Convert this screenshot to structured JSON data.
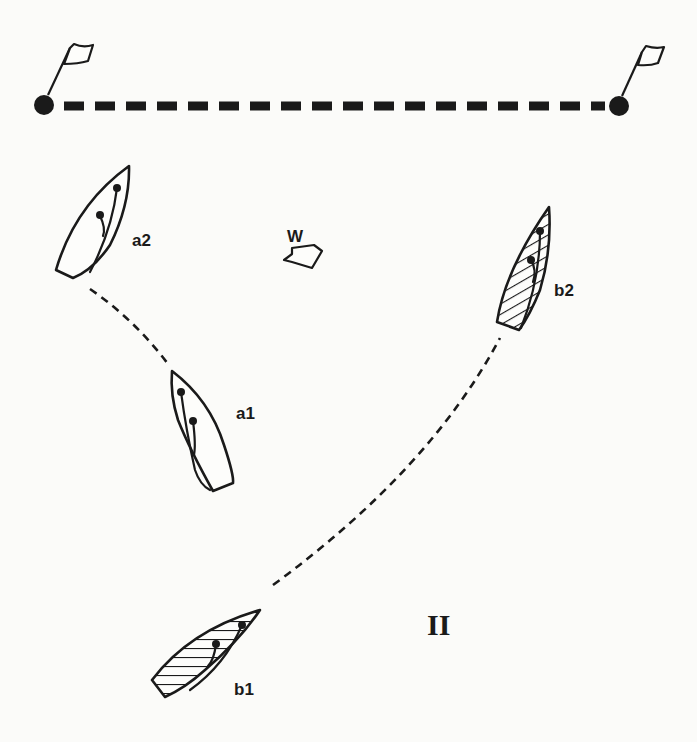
{
  "diagram": {
    "title_numeral": "II",
    "wind": {
      "label": "W",
      "icon": "wind-arrow-icon"
    },
    "start_line": {
      "left_mark": {
        "icon": "flag-icon"
      },
      "right_mark": {
        "icon": "flag-icon"
      }
    },
    "boats": [
      {
        "id": "a2",
        "label": "a2",
        "style": "outline",
        "position": "upper-left"
      },
      {
        "id": "a1",
        "label": "a1",
        "style": "outline",
        "position": "middle-left"
      },
      {
        "id": "b2",
        "label": "b2",
        "style": "hatched",
        "position": "upper-right"
      },
      {
        "id": "b1",
        "label": "b1",
        "style": "hatched",
        "position": "lower-left"
      }
    ],
    "tracks": [
      {
        "from": "a1",
        "to": "a2"
      },
      {
        "from": "b1",
        "to": "b2"
      }
    ],
    "colors": {
      "ink": "#1a1a1a",
      "paper": "#fbfbf9"
    }
  }
}
